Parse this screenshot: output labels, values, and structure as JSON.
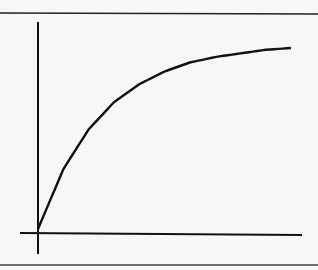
{
  "chart_data": {
    "type": "line",
    "title": "",
    "xlabel": "",
    "ylabel": "",
    "grid": false,
    "legend": [],
    "x": [
      0,
      0.1,
      0.2,
      0.3,
      0.4,
      0.5,
      0.6,
      0.7,
      0.8,
      0.9,
      1.0
    ],
    "series": [
      {
        "name": "curve",
        "values": [
          0.0,
          0.33,
          0.55,
          0.7,
          0.8,
          0.87,
          0.92,
          0.95,
          0.97,
          0.99,
          1.0
        ]
      }
    ],
    "xlim": [
      0,
      1
    ],
    "ylim": [
      0,
      1
    ],
    "xticks": [],
    "yticks": []
  },
  "colors": {
    "background": "#f7f7f5",
    "line": "#111111",
    "border": "#222222"
  }
}
